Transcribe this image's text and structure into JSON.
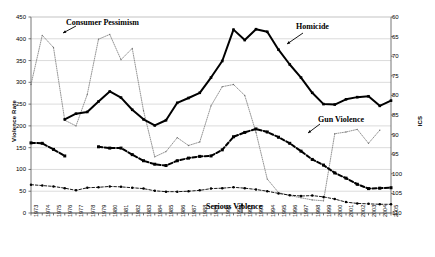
{
  "chart_data": {
    "type": "line",
    "title": "",
    "xlabel": "",
    "ylabel": "Violence Rate",
    "y2label": "ICS",
    "ylim": [
      0,
      450
    ],
    "y2lim": [
      110,
      60
    ],
    "y2_inverted": true,
    "yticks": [
      0,
      50,
      100,
      150,
      200,
      250,
      300,
      350,
      400,
      450
    ],
    "y2ticks": [
      60,
      65,
      70,
      75,
      80,
      85,
      90,
      95,
      100,
      105,
      110
    ],
    "grid": true,
    "legend_position": "inline-annotations",
    "x": [
      1973,
      1974,
      1975,
      1976,
      1977,
      1978,
      1979,
      1980,
      1981,
      1982,
      1983,
      1984,
      1985,
      1986,
      1987,
      1988,
      1989,
      1990,
      1991,
      1992,
      1993,
      1994,
      1995,
      1996,
      1997,
      1998,
      1999,
      2000,
      2001,
      2002,
      2003,
      2004,
      2005
    ],
    "categories": [
      "1973",
      "1974",
      "1975",
      "1976",
      "1977",
      "1978",
      "1979",
      "1980",
      "1981",
      "1982",
      "1983",
      "1984",
      "1985",
      "1986",
      "1987",
      "1988",
      "1989",
      "1990",
      "1991",
      "1992",
      "1993",
      "1994",
      "1995",
      "1996",
      "1997",
      "1998",
      "1999",
      "2000",
      "2001",
      "2002",
      "2003",
      "2004",
      "2005"
    ],
    "series": [
      {
        "name": "Homicide",
        "axis": "left",
        "style": "solid-thick-marker",
        "color": "#000000",
        "values": [
          null,
          null,
          null,
          215,
          228,
          232,
          256,
          279,
          265,
          237,
          215,
          201,
          213,
          253,
          264,
          276,
          311,
          349,
          421,
          397,
          422,
          416,
          375,
          341,
          311,
          276,
          250,
          249,
          261,
          266,
          268,
          246,
          258
        ]
      },
      {
        "name": "Gun Violence",
        "axis": "left",
        "style": "dashed-thick-marker",
        "color": "#000000",
        "values": [
          161,
          160,
          146,
          131,
          null,
          null,
          152,
          149,
          149,
          134,
          120,
          112,
          109,
          120,
          126,
          130,
          131,
          145,
          175,
          185,
          193,
          186,
          174,
          160,
          142,
          123,
          110,
          92,
          80,
          66,
          56,
          57,
          58
        ]
      },
      {
        "name": "Serious Violence",
        "axis": "left",
        "style": "dotted-thin-marker",
        "color": "#000000",
        "values": [
          65,
          63,
          61,
          57,
          52,
          58,
          59,
          61,
          60,
          58,
          56,
          51,
          49,
          49,
          50,
          52,
          56,
          57,
          59,
          57,
          54,
          50,
          45,
          41,
          39,
          40,
          37,
          32,
          25,
          22,
          21,
          20,
          20
        ]
      },
      {
        "name": "Consumer Pessimism",
        "axis": "right",
        "style": "dotted-fine",
        "color": "#808080",
        "values_left_scale": [
          295,
          408,
          380,
          213,
          200,
          272,
          399,
          410,
          352,
          378,
          235,
          129,
          141,
          173,
          155,
          163,
          246,
          290,
          295,
          270,
          185,
          78,
          47,
          40,
          35,
          30,
          28,
          182,
          186,
          192,
          160,
          190,
          null
        ],
        "values": [
          76.2,
          63.4,
          66.8,
          85.4,
          86.9,
          78.9,
          65.6,
          64.3,
          71.1,
          68.2,
          83.9,
          95.7,
          94.3,
          90.8,
          92.8,
          91.9,
          80.3,
          75.4,
          74.9,
          77.7,
          89.4,
          101.3,
          104.8,
          105.6,
          106.1,
          106.7,
          106.9,
          89.8,
          89.4,
          88.7,
          92.2,
          88.9,
          null
        ]
      }
    ],
    "annotations": [
      {
        "name": "consumer-pessimism",
        "text": "Consumer Pessimism"
      },
      {
        "name": "homicide",
        "text": "Homicide"
      },
      {
        "name": "gun-violence",
        "text": "Gun Violence"
      },
      {
        "name": "serious-violence",
        "text": "Serious Violence"
      }
    ]
  },
  "axes": {
    "left_title": "Violence Rate",
    "right_title": "ICS"
  },
  "annotations": {
    "consumer_pessimism": "Consumer Pessimism",
    "homicide": "Homicide",
    "gun_violence": "Gun Violence",
    "serious_violence": "Serious Violence"
  }
}
